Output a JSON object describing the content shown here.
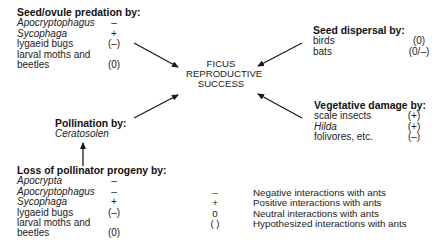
{
  "center": {
    "lines": [
      "FICUS",
      "REPRODUCTIVE",
      "SUCCESS"
    ]
  },
  "seed_predation": {
    "title": "Seed/ovule predation by:",
    "items": [
      {
        "name": "Apocryptophagus",
        "italic": true,
        "symbol": "–"
      },
      {
        "name": "Sycophaga",
        "italic": true,
        "symbol": "+"
      },
      {
        "name": "lygaeid bugs",
        "italic": false,
        "symbol": "(–)"
      },
      {
        "name": "larval moths and",
        "italic": false,
        "symbol": ""
      },
      {
        "name": "beetles",
        "italic": false,
        "symbol": "(0)"
      }
    ]
  },
  "seed_dispersal": {
    "title": "Seed dispersal by:",
    "items": [
      {
        "name": "birds",
        "italic": false,
        "symbol": "(0)"
      },
      {
        "name": "bats",
        "italic": false,
        "symbol": "(0/–)"
      }
    ]
  },
  "vegetative_damage": {
    "title": "Vegetative damage by:",
    "items": [
      {
        "name": "scale insects",
        "italic": false,
        "symbol": "(+)"
      },
      {
        "name": "Hilda",
        "italic": true,
        "symbol": "(+)"
      },
      {
        "name": "folivores, etc.",
        "italic": false,
        "symbol": "(–)"
      }
    ]
  },
  "pollination": {
    "title": "Pollination by:",
    "items": [
      {
        "name": "Ceratosolen",
        "italic": true,
        "symbol": ""
      }
    ]
  },
  "pollinator_loss": {
    "title": "Loss of pollinator progeny by:",
    "items": [
      {
        "name": "Apocrypta",
        "italic": true,
        "symbol": "–"
      },
      {
        "name": "Apocryptophagus",
        "italic": true,
        "symbol": "–"
      },
      {
        "name": "Sycophaga",
        "italic": true,
        "symbol": "+"
      },
      {
        "name": "lygaeid bugs",
        "italic": false,
        "symbol": "(–)"
      },
      {
        "name": "larval moths and",
        "italic": false,
        "symbol": ""
      },
      {
        "name": "beetles",
        "italic": false,
        "symbol": "(0)"
      }
    ]
  },
  "legend": {
    "items": [
      {
        "symbol": "–",
        "text": "Negative interactions with ants"
      },
      {
        "symbol": "+",
        "text": "Positive interactions with ants"
      },
      {
        "symbol": "0",
        "text": "Neutral interactions with ants"
      },
      {
        "symbol": "( )",
        "text": "Hypothesized interactions with ants"
      }
    ]
  },
  "colors": {
    "text": "#222222",
    "arrow": "#1a1a1a",
    "background": "#ffffff"
  }
}
